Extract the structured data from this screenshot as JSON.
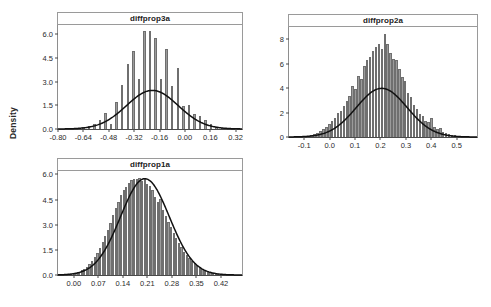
{
  "figure": {
    "ylabel": "Density",
    "panel_count": 3
  },
  "chart_data": [
    {
      "type": "bar",
      "title": "diffprop3a",
      "xlabel": "",
      "ylabel": "Density",
      "xlim": [
        -0.8,
        0.36
      ],
      "ylim": [
        0,
        6.6
      ],
      "xticks": [
        "-0.80",
        "-0.64",
        "-0.48",
        "-0.32",
        "-0.16",
        "0.00",
        "0.16",
        "0.32"
      ],
      "xtick_values": [
        -0.8,
        -0.64,
        -0.48,
        -0.32,
        -0.16,
        0.0,
        0.16,
        0.32
      ],
      "yticks": [
        "0.0",
        "1.5",
        "3.0",
        "4.5",
        "6.0"
      ],
      "ytick_values": [
        0.0,
        1.5,
        3.0,
        4.5,
        6.0
      ],
      "grid": false,
      "legend": "none",
      "bar_style": "discrete-spiked",
      "bin_width": 0.018,
      "bar_fill": "#9b9b9b",
      "bar_edge": "#6f6f6f",
      "curve_color": "#111111",
      "curve_label": "normal density overlay",
      "curve_mean": -0.205,
      "curve_sd": 0.163,
      "curve_peak": 2.45,
      "categories": [
        -0.745,
        -0.71,
        -0.675,
        -0.64,
        -0.605,
        -0.57,
        -0.535,
        -0.5,
        -0.465,
        -0.43,
        -0.395,
        -0.36,
        -0.325,
        -0.29,
        -0.255,
        -0.22,
        -0.185,
        -0.15,
        -0.115,
        -0.08,
        -0.045,
        -0.01,
        0.025,
        0.06,
        0.095,
        0.13,
        0.165,
        0.2,
        0.235
      ],
      "values": [
        0.0,
        0.0,
        0.05,
        0.12,
        0.18,
        0.3,
        0.55,
        1.0,
        0.35,
        1.7,
        2.8,
        4.1,
        4.95,
        3.15,
        6.25,
        6.25,
        5.75,
        3.15,
        5.1,
        2.7,
        3.85,
        1.45,
        1.5,
        0.95,
        0.85,
        0.55,
        0.3,
        0.12,
        0.05
      ]
    },
    {
      "type": "bar",
      "title": "diffprop2a",
      "xlabel": "",
      "ylabel": "Density",
      "xlim": [
        -0.16,
        0.58
      ],
      "ylim": [
        0,
        9.0
      ],
      "xticks": [
        "-0.1",
        "0.0",
        "0.1",
        "0.2",
        "0.3",
        "0.4",
        "0.5"
      ],
      "xtick_values": [
        -0.1,
        0.0,
        0.1,
        0.2,
        0.3,
        0.4,
        0.5
      ],
      "yticks": [
        "0",
        "2",
        "4",
        "6",
        "8"
      ],
      "ytick_values": [
        0,
        2,
        4,
        6,
        8
      ],
      "grid": false,
      "legend": "none",
      "bar_style": "dense-bins",
      "bin_width": 0.0115,
      "bar_fill": "#9b9b9b",
      "bar_edge": "#6f6f6f",
      "curve_color": "#111111",
      "curve_label": "normal density overlay",
      "curve_mean": 0.205,
      "curve_sd": 0.1,
      "curve_peak": 3.98,
      "categories": [
        -0.105,
        -0.0935,
        -0.082,
        -0.0705,
        -0.059,
        -0.0475,
        -0.036,
        -0.0245,
        -0.013,
        -0.0015,
        0.01,
        0.0215,
        0.033,
        0.0445,
        0.056,
        0.0675,
        0.079,
        0.0905,
        0.102,
        0.1135,
        0.125,
        0.1365,
        0.148,
        0.1595,
        0.171,
        0.1825,
        0.194,
        0.2055,
        0.217,
        0.2285,
        0.24,
        0.2515,
        0.263,
        0.2745,
        0.286,
        0.2975,
        0.309,
        0.3205,
        0.332,
        0.3435,
        0.355,
        0.3665,
        0.378,
        0.3895,
        0.401,
        0.4125,
        0.424,
        0.4355,
        0.447,
        0.4585,
        0.47,
        0.4815,
        0.493,
        0.5045,
        0.516,
        0.5275
      ],
      "values": [
        0.05,
        0.08,
        0.12,
        0.18,
        0.25,
        0.35,
        0.48,
        0.62,
        0.8,
        1.05,
        1.3,
        1.55,
        1.95,
        2.1,
        2.55,
        2.95,
        3.35,
        4.15,
        3.9,
        5.0,
        4.75,
        5.85,
        6.3,
        6.55,
        7.05,
        7.35,
        7.6,
        7.2,
        8.45,
        7.6,
        6.85,
        6.4,
        6.3,
        5.55,
        4.9,
        4.55,
        3.6,
        3.25,
        2.6,
        2.3,
        1.85,
        1.7,
        1.35,
        1.25,
        1.55,
        0.85,
        0.65,
        0.7,
        0.45,
        0.35,
        0.28,
        0.2,
        0.15,
        0.1,
        0.06,
        0.04
      ]
    },
    {
      "type": "bar",
      "title": "diffprop1a",
      "xlabel": "",
      "ylabel": "Density",
      "xlim": [
        -0.045,
        0.48
      ],
      "ylim": [
        0,
        6.2
      ],
      "xticks": [
        "0.00",
        "0.07",
        "0.14",
        "0.21",
        "0.28",
        "0.35",
        "0.42"
      ],
      "xtick_values": [
        0.0,
        0.07,
        0.14,
        0.21,
        0.28,
        0.35,
        0.42
      ],
      "yticks": [
        "0.0",
        "1.5",
        "3.0",
        "4.5",
        "6.0"
      ],
      "ytick_values": [
        0.0,
        1.5,
        3.0,
        4.5,
        6.0
      ],
      "grid": false,
      "legend": "none",
      "bar_style": "dense-bins",
      "bin_width": 0.0075,
      "bar_fill": "#9b9b9b",
      "bar_edge": "#6f6f6f",
      "curve_color": "#111111",
      "curve_label": "normal density overlay",
      "curve_mean": 0.203,
      "curve_sd": 0.0695,
      "curve_peak": 5.74,
      "categories": [
        -0.0225,
        -0.015,
        -0.0075,
        0.0,
        0.0075,
        0.015,
        0.0225,
        0.03,
        0.0375,
        0.045,
        0.0525,
        0.06,
        0.0675,
        0.075,
        0.0825,
        0.09,
        0.0975,
        0.105,
        0.1125,
        0.12,
        0.1275,
        0.135,
        0.1425,
        0.15,
        0.1575,
        0.165,
        0.1725,
        0.18,
        0.1875,
        0.195,
        0.2025,
        0.21,
        0.2175,
        0.225,
        0.2325,
        0.24,
        0.2475,
        0.255,
        0.2625,
        0.27,
        0.2775,
        0.285,
        0.2925,
        0.3,
        0.3075,
        0.315,
        0.3225,
        0.33,
        0.3375,
        0.345,
        0.3525,
        0.36,
        0.3675,
        0.375,
        0.3825,
        0.39,
        0.3975,
        0.405,
        0.4125,
        0.42,
        0.4275,
        0.435
      ],
      "values": [
        0.02,
        0.04,
        0.06,
        0.1,
        0.14,
        0.2,
        0.28,
        0.38,
        0.5,
        0.65,
        0.85,
        1.05,
        1.3,
        1.6,
        1.95,
        2.3,
        2.7,
        3.1,
        3.55,
        4.0,
        4.35,
        4.75,
        5.05,
        5.25,
        5.5,
        5.65,
        5.75,
        5.7,
        5.8,
        5.6,
        5.7,
        5.45,
        5.3,
        5.05,
        4.65,
        4.35,
        4.55,
        3.9,
        3.5,
        3.15,
        2.85,
        2.5,
        2.2,
        1.9,
        1.65,
        1.4,
        1.2,
        1.0,
        0.85,
        0.7,
        0.58,
        0.46,
        0.36,
        0.28,
        0.22,
        0.16,
        0.12,
        0.09,
        0.06,
        0.04,
        0.03,
        0.02
      ]
    }
  ]
}
